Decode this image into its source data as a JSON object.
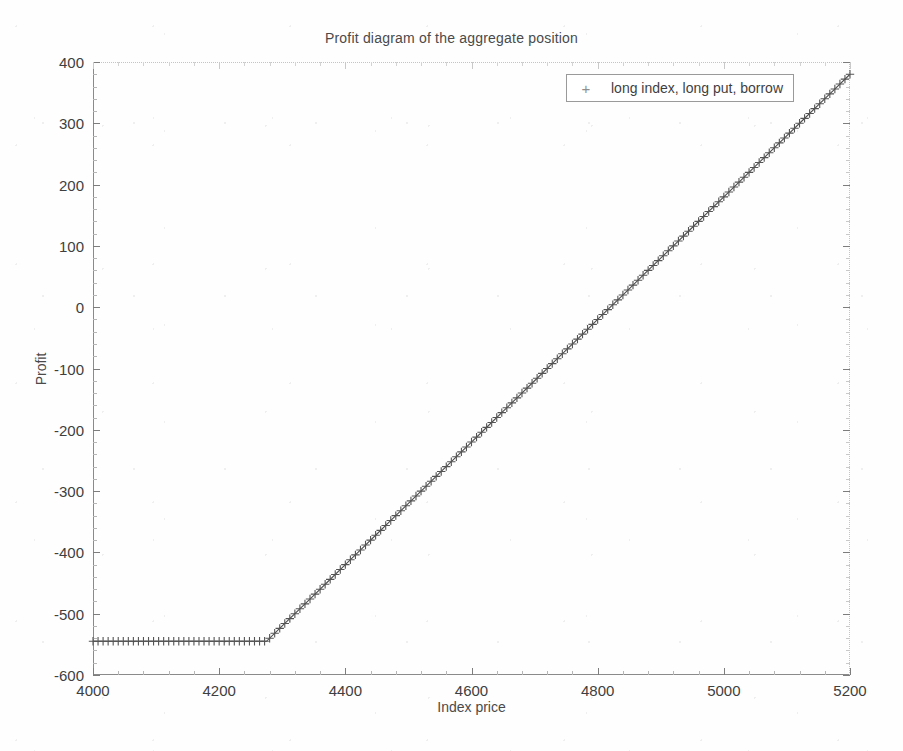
{
  "chart_data": {
    "type": "line",
    "title": "Profit diagram of the aggregate position",
    "xlabel": "Index price",
    "ylabel": "Profit",
    "xlim": [
      4000,
      5200
    ],
    "ylim": [
      -600,
      400
    ],
    "xticks": [
      4000,
      4200,
      4400,
      4600,
      4800,
      5000,
      5200
    ],
    "yticks": [
      -600,
      -500,
      -400,
      -300,
      -200,
      -100,
      0,
      100,
      200,
      300,
      400
    ],
    "grid": false,
    "legend_position": "top right",
    "marker": "+",
    "line_color": "#4d4d4d",
    "series": [
      {
        "name": "long index, long put, borrow",
        "marker": "+",
        "strike": 4275,
        "floor_profit": -545,
        "x": [
          4000,
          4025,
          4050,
          4075,
          4100,
          4125,
          4150,
          4175,
          4200,
          4225,
          4250,
          4275,
          4300,
          4325,
          4350,
          4375,
          4400,
          4425,
          4450,
          4475,
          4500,
          4525,
          4550,
          4575,
          4600,
          4625,
          4650,
          4675,
          4700,
          4725,
          4750,
          4775,
          4800,
          4825,
          4850,
          4875,
          4900,
          4925,
          4950,
          4975,
          5000,
          5025,
          5050,
          5075,
          5100,
          5125,
          5150,
          5175,
          5200
        ],
        "values": [
          -545,
          -545,
          -545,
          -545,
          -545,
          -545,
          -545,
          -545,
          -545,
          -545,
          -545,
          -545,
          -520,
          -495,
          -470,
          -445,
          -420,
          -395,
          -370,
          -345,
          -320,
          -295,
          -270,
          -245,
          -220,
          -195,
          -170,
          -145,
          -120,
          -95,
          -70,
          -45,
          -20,
          5,
          30,
          55,
          80,
          105,
          130,
          155,
          180,
          205,
          230,
          255,
          280,
          305,
          330,
          355,
          380
        ]
      }
    ]
  },
  "legend": {
    "entries": [
      {
        "label": "long index, long put, borrow",
        "marker": "+"
      }
    ]
  },
  "axes": {
    "x": {
      "title": "Index price",
      "tick_labels": [
        "4000",
        "4200",
        "4400",
        "4600",
        "4800",
        "5000",
        "5200"
      ]
    },
    "y": {
      "title": "Profit",
      "tick_labels": [
        "400",
        "300",
        "200",
        "100",
        "0",
        "-100",
        "-200",
        "-300",
        "-400",
        "-500",
        "-600"
      ]
    }
  },
  "colors": {
    "background": "#ffffff",
    "axis": "#8a8a8a",
    "text": "#3f3f3f",
    "data": "#4d4d4d"
  }
}
